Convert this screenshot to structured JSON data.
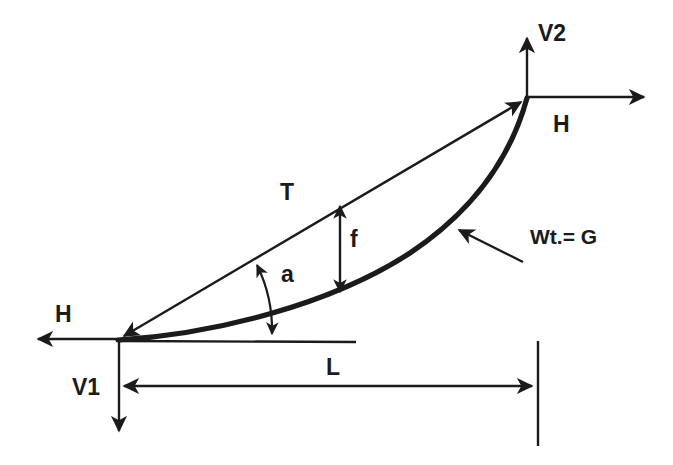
{
  "figure": {
    "background_color": "#ffffff",
    "ink_color": "#1b1b1b",
    "width": 673,
    "height": 465
  },
  "labels": {
    "v2": "V2",
    "h_right": "H",
    "h_left": "H",
    "v1": "V1",
    "tension": "T",
    "sag": "f",
    "angle": "a",
    "weight": "Wt.= G",
    "span": "L"
  },
  "elements": {
    "left_support": "left-support-node",
    "right_support": "right-support-node",
    "cable": "catenary-cable-curve",
    "chord": "tension-chord-arrow",
    "baseline": "horizontal-baseline",
    "span_dimension": "span-dimension-line",
    "sag_dimension": "sag-dimension-arrow",
    "angle_arc": "angle-arc",
    "weight_pointer": "weight-leader-arrow"
  },
  "geometry": {
    "left_node": [
      118,
      339
    ],
    "right_node": [
      527,
      97
    ],
    "sag_station_x": 340,
    "sag_top_y": 205,
    "sag_bottom_y": 292,
    "baseline_y": 341,
    "baseline_end_x": 356,
    "span_line_y": 386,
    "span_from_x": 118,
    "span_to_x": 537,
    "v1_tip_y": 438,
    "v2_tip_y": 31,
    "h_left_tip_x": 32,
    "h_right_tip_x": 650
  }
}
